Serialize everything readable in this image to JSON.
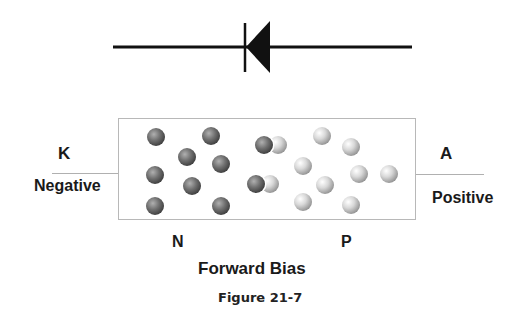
{
  "diagram": {
    "symbol": {
      "name": "diode",
      "orientation": "cathode-left"
    },
    "terminals": {
      "left": {
        "letter": "K",
        "polarity": "Negative"
      },
      "right": {
        "letter": "A",
        "polarity": "Positive"
      }
    },
    "regions": {
      "left": "N",
      "right": "P"
    },
    "title": "Forward Bias",
    "caption": "Figure 21-7",
    "colors": {
      "line": "#111111",
      "box_border": "#b8b8b8",
      "electron_dark": "#555555",
      "hole_light": "#c8c8c8",
      "text": "#1a1a1a"
    },
    "carriers": {
      "electrons_n_region": [
        [
          156,
          137
        ],
        [
          211,
          136
        ],
        [
          187,
          157
        ],
        [
          221,
          164
        ],
        [
          155,
          175
        ],
        [
          192,
          186
        ],
        [
          155,
          206
        ],
        [
          221,
          206
        ]
      ],
      "holes_p_region": [
        [
          322,
          136
        ],
        [
          351,
          147
        ],
        [
          303,
          166
        ],
        [
          359,
          174
        ],
        [
          389,
          174
        ],
        [
          325,
          185
        ],
        [
          303,
          202
        ],
        [
          351,
          205
        ]
      ],
      "recombining_pairs": [
        {
          "electron": [
            264,
            145
          ],
          "hole": [
            278,
            145
          ]
        },
        {
          "electron": [
            256,
            184
          ],
          "hole": [
            270,
            184
          ]
        }
      ]
    }
  }
}
